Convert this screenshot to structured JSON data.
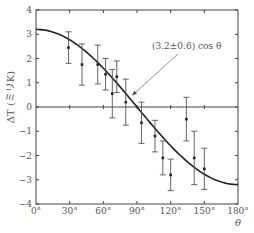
{
  "chart_data": {
    "type": "scatter",
    "title": "",
    "xlabel": "θ",
    "ylabel": "ΔT (ミリK)",
    "xlim": [
      0,
      180
    ],
    "ylim": [
      -4,
      4
    ],
    "xticks": [
      0,
      30,
      60,
      90,
      120,
      150,
      180
    ],
    "xtick_labels": [
      "0°",
      "30°",
      "60°",
      "90°",
      "120°",
      "150°",
      "180°"
    ],
    "yticks": [
      4,
      3,
      2,
      1,
      0,
      -1,
      -2,
      -3,
      -4
    ],
    "ytick_labels": [
      "4",
      "3",
      "2",
      "1",
      "0",
      "−1",
      "−2",
      "−3",
      "−4"
    ],
    "grid": false,
    "legend": null,
    "series": [
      {
        "name": "measurements",
        "kind": "points_with_error_bars",
        "x": [
          29,
          41,
          55,
          62,
          68,
          72,
          80,
          94,
          106,
          113,
          120,
          134,
          141,
          150
        ],
        "y": [
          2.45,
          1.75,
          1.75,
          1.35,
          0.55,
          1.25,
          0.2,
          -0.65,
          -1.2,
          -2.1,
          -2.8,
          -0.5,
          -2.1,
          -2.55
        ],
        "err": [
          0.65,
          0.85,
          0.8,
          0.65,
          1.0,
          0.65,
          0.95,
          0.85,
          0.65,
          0.7,
          0.65,
          0.9,
          1.1,
          0.85
        ]
      },
      {
        "name": "fit",
        "kind": "curve",
        "function": "3.2 cos θ",
        "amplitude": 3.2
      }
    ],
    "annotations": [
      {
        "text": "(3.2±0.6) cos θ",
        "arrow_to_x": 84,
        "arrow_to_y": 0.4
      }
    ],
    "zero_line": true
  }
}
